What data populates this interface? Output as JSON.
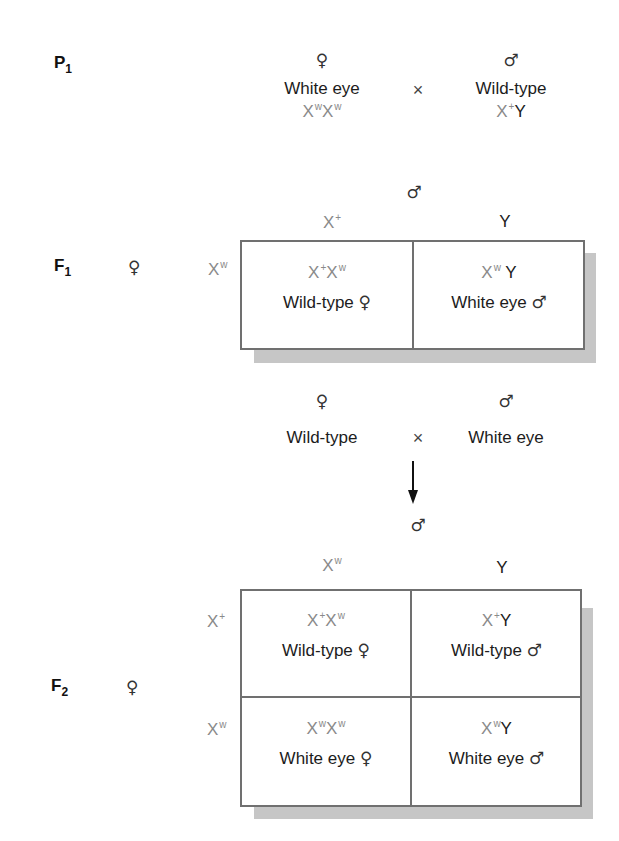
{
  "p1": {
    "label": "P",
    "label_sub": "1",
    "female": {
      "symbol": "♀",
      "phenotype": "White eye",
      "genotype": [
        {
          "base": "X",
          "sup": "w"
        },
        {
          "base": "X",
          "sup": "w"
        }
      ]
    },
    "cross_symbol": "×",
    "male": {
      "symbol": "♂",
      "phenotype": "Wild-type",
      "genotype": [
        {
          "base": "X",
          "sup": "+"
        },
        {
          "base": "Y",
          "sup": ""
        }
      ]
    }
  },
  "f1": {
    "label": "F",
    "label_sub": "1",
    "male_parent_symbol": "♂",
    "female_parent_symbol": "♀",
    "columns": [
      {
        "base": "X",
        "sup": "+"
      },
      {
        "base": "Y",
        "sup": ""
      }
    ],
    "rows": [
      {
        "base": "X",
        "sup": "w"
      }
    ],
    "cells": [
      [
        {
          "genotype": [
            {
              "base": "X",
              "sup": "+"
            },
            {
              "base": "X",
              "sup": "w"
            }
          ],
          "phenotype": "Wild-type",
          "sex": "♀"
        },
        {
          "genotype": [
            {
              "base": "X",
              "sup": "w"
            },
            {
              "base": "Y",
              "sup": ""
            }
          ],
          "phenotype": "White eye",
          "sex": "♂"
        }
      ]
    ]
  },
  "f1_cross": {
    "female": {
      "symbol": "♀",
      "phenotype": "Wild-type"
    },
    "cross_symbol": "×",
    "male": {
      "symbol": "♂",
      "phenotype": "White eye"
    },
    "arrow": "down-arrow"
  },
  "f2": {
    "label": "F",
    "label_sub": "2",
    "male_parent_symbol": "♂",
    "female_parent_symbol": "♀",
    "columns": [
      {
        "base": "X",
        "sup": "w"
      },
      {
        "base": "Y",
        "sup": ""
      }
    ],
    "rows": [
      {
        "base": "X",
        "sup": "+"
      },
      {
        "base": "X",
        "sup": "w"
      }
    ],
    "cells": [
      [
        {
          "genotype": [
            {
              "base": "X",
              "sup": "+"
            },
            {
              "base": "X",
              "sup": "w"
            }
          ],
          "phenotype": "Wild-type",
          "sex": "♀"
        },
        {
          "genotype": [
            {
              "base": "X",
              "sup": "+"
            },
            {
              "base": "Y",
              "sup": ""
            }
          ],
          "phenotype": "Wild-type",
          "sex": "♂"
        }
      ],
      [
        {
          "genotype": [
            {
              "base": "X",
              "sup": "w"
            },
            {
              "base": "X",
              "sup": "w"
            }
          ],
          "phenotype": "White eye",
          "sex": "♀"
        },
        {
          "genotype": [
            {
              "base": "X",
              "sup": "w"
            },
            {
              "base": "Y",
              "sup": ""
            }
          ],
          "phenotype": "White eye",
          "sex": "♂"
        }
      ]
    ]
  },
  "colors": {
    "x_chromosome": "#8a8a8a",
    "y_chromosome": "#1c1c1c",
    "text": "#1c1c1c",
    "border": "#707070",
    "shadow": "#c6c6c6"
  }
}
